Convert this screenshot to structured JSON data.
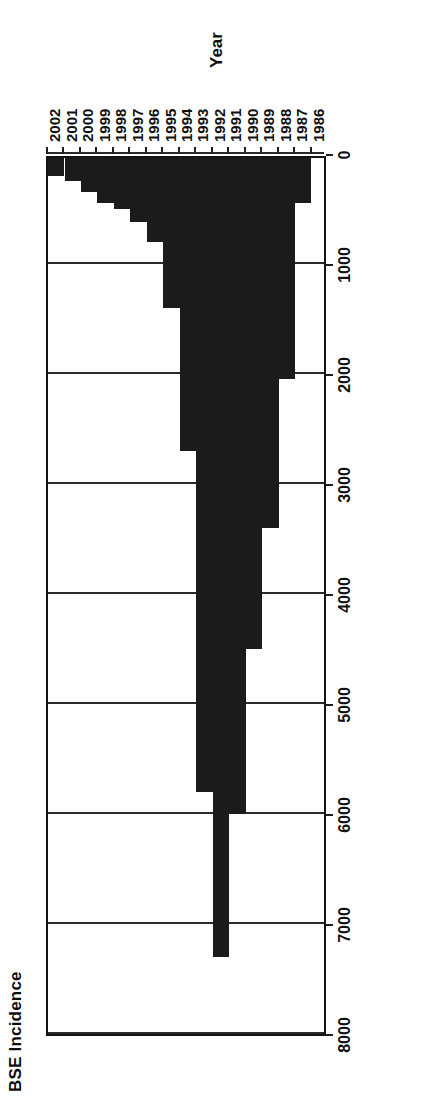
{
  "chart_data": {
    "type": "bar",
    "orientation": "horizontal",
    "title": "BSE Incidence",
    "xlabel": "Year",
    "ylabel": "BSE Incidence",
    "categories": [
      "1986",
      "1987",
      "1988",
      "1989",
      "1990",
      "1991",
      "1992",
      "1993",
      "1994",
      "1995",
      "1996",
      "1997",
      "1998",
      "1999",
      "2000",
      "2001",
      "2002"
    ],
    "values": [
      0,
      450,
      2050,
      3400,
      4500,
      6000,
      7300,
      5800,
      2700,
      1400,
      800,
      620,
      500,
      450,
      350,
      250,
      200
    ],
    "value_axis_ticks": [
      "8000",
      "7000",
      "6000",
      "5000",
      "4000",
      "3000",
      "2000",
      "1000",
      "0"
    ],
    "value_axis_tick_values": [
      8000,
      7000,
      6000,
      5000,
      4000,
      3000,
      2000,
      1000,
      0
    ],
    "xlim": [
      0,
      8000
    ],
    "grid": true,
    "legend": false,
    "bar_color": "#1b1b1b",
    "axis_color": "#141414",
    "background": "#ffffff"
  }
}
